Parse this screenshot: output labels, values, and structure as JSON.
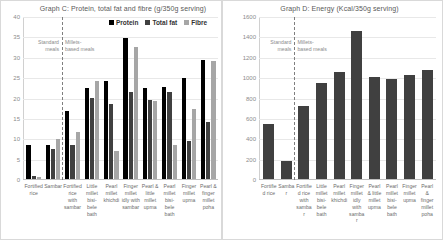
{
  "panels": {
    "c": {
      "title": "Graph C: Protein, total fat and fibre (g/350g serving)",
      "annotation_left": "Standard meals",
      "annotation_right": "Millets-based meals",
      "legend": [
        {
          "label": "Protein",
          "color": "#000000"
        },
        {
          "label": "Total fat",
          "color": "#404040"
        },
        {
          "label": "Fibre",
          "color": "#a6a6a6"
        }
      ]
    },
    "d": {
      "title": "Graph D: Energy (Kcal/350g serving)",
      "annotation_left": "Standard meals",
      "annotation_right": "Millets-based meals",
      "bar_color": "#404040"
    }
  },
  "chart_data": [
    {
      "type": "bar",
      "title": "Graph C: Protein, total fat and fibre (g/350g serving)",
      "xlabel": "",
      "ylabel": "",
      "ylim": [
        0,
        40
      ],
      "yticks": [
        0,
        5,
        10,
        15,
        20,
        25,
        30,
        35,
        40
      ],
      "grid": true,
      "legend_position": "top-right",
      "divider_after_index": 2,
      "annotations": [
        "Standard meals",
        "Millets-based meals"
      ],
      "categories": [
        "Fortified rice",
        "Sambar",
        "Fortified rice with sambar",
        "Little millet bisi-bele bath",
        "Pearl millet khichdi",
        "Finger millet idly with sambar",
        "Pearl & little millet upma",
        "Pearl millet bisi-bele bath",
        "Finger millet upma",
        "Pearl & finger millet poha"
      ],
      "series": [
        {
          "name": "Protein",
          "color": "#000000",
          "values": [
            8.5,
            8.5,
            16.8,
            22.5,
            24.3,
            34.8,
            22.4,
            22.7,
            24.9,
            29.4
          ]
        },
        {
          "name": "Total fat",
          "color": "#404040",
          "values": [
            0.8,
            7.3,
            8.5,
            20.1,
            18.4,
            21.6,
            19.4,
            21.5,
            9.5,
            14.1
          ]
        },
        {
          "name": "Fibre",
          "color": "#a6a6a6",
          "values": [
            0.5,
            10.0,
            11.7,
            24.2,
            6.8,
            32.7,
            19.2,
            8.3,
            17.4,
            29.2
          ]
        }
      ]
    },
    {
      "type": "bar",
      "title": "Graph D: Energy (Kcal/350g serving)",
      "xlabel": "",
      "ylabel": "",
      "ylim": [
        0,
        1600
      ],
      "yticks": [
        0,
        200,
        400,
        600,
        800,
        1000,
        1200,
        1400,
        1600
      ],
      "grid": true,
      "divider_after_index": 2,
      "annotations": [
        "Standard meals",
        "Millets-based meals"
      ],
      "categories": [
        "Fortified rice",
        "Sambar",
        "Fortified rice with sambar",
        "Little millet bisi-bele bath",
        "Pearl millet khichdi",
        "Finger millet idly with sambar",
        "Pearl & little millet upma",
        "Pearl millet bisi-bele bath",
        "Finger millet upma",
        "Pearl & finger millet poha"
      ],
      "series": [
        {
          "name": "Energy",
          "color": "#404040",
          "values": [
            540,
            180,
            720,
            950,
            1055,
            1465,
            1010,
            985,
            1030,
            1075
          ]
        }
      ]
    }
  ]
}
